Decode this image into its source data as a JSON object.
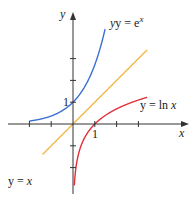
{
  "chart_data": {
    "type": "line",
    "title": "",
    "xlabel": "x",
    "ylabel": "y",
    "xlim": [
      -2,
      3.4
    ],
    "ylim": [
      -2.5,
      4
    ],
    "x_ticks": [
      -2,
      -1,
      0,
      1,
      2,
      3
    ],
    "y_ticks": [
      -2,
      -1,
      1,
      2,
      3
    ],
    "tick_labels": {
      "x_one": "1",
      "y_one": "1"
    },
    "grid": false,
    "series": [
      {
        "name": "y = e^x",
        "label_main": "y = e",
        "label_sup": "x",
        "color": "#3b6fd4",
        "function": "exp",
        "domain": [
          -2,
          1.47
        ]
      },
      {
        "name": "y = x",
        "label_main": "y = ",
        "label_var": "x",
        "color": "#f2b844",
        "function": "identity",
        "domain": [
          -1.4,
          3.4
        ]
      },
      {
        "name": "y = ln x",
        "label_main": "y = ln ",
        "label_var": "x",
        "color": "#e0303a",
        "function": "log",
        "domain": [
          0.06,
          3.4
        ]
      }
    ]
  }
}
